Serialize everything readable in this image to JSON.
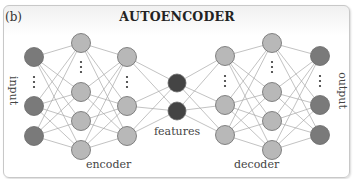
{
  "panel_label": "(b)",
  "title": "AUTOENCODER",
  "labels": {
    "input": "input",
    "output": "output",
    "encoder": "encoder",
    "decoder": "decoder",
    "features": "features"
  },
  "colors": {
    "io_node": "#7a7a7a",
    "hidden_node": "#b8b8b8",
    "feature_node": "#444444",
    "edge": "#a8a8a8",
    "node_stroke": "#6a6a6a"
  },
  "layers": [
    {
      "name": "input",
      "x": 34,
      "nodes": [
        57,
        106,
        136
      ],
      "dots_y": 82,
      "type": "io"
    },
    {
      "name": "encoder-hidden-1",
      "x": 81,
      "nodes": [
        43,
        92,
        121,
        150
      ],
      "dots_y": 67,
      "type": "hidden"
    },
    {
      "name": "encoder-hidden-2",
      "x": 127,
      "nodes": [
        57,
        106,
        136
      ],
      "dots_y": 82,
      "type": "hidden"
    },
    {
      "name": "features",
      "x": 177,
      "nodes": [
        83,
        111
      ],
      "type": "feature"
    },
    {
      "name": "decoder-hidden-1",
      "x": 225,
      "nodes": [
        56,
        105,
        135
      ],
      "dots_y": 81,
      "type": "hidden"
    },
    {
      "name": "decoder-hidden-2",
      "x": 272,
      "nodes": [
        43,
        92,
        121,
        150
      ],
      "dots_y": 67,
      "type": "hidden"
    },
    {
      "name": "output",
      "x": 320,
      "nodes": [
        56,
        105,
        135
      ],
      "dots_y": 81,
      "type": "io"
    }
  ]
}
